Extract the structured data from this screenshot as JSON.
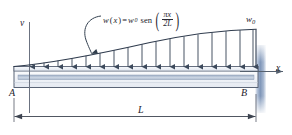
{
  "figure": {
    "kind": "cantilever-beam-distributed-load",
    "labels": {
      "vertical_axis": "v",
      "horizontal_axis": "x",
      "left_end": "A",
      "right_end": "B",
      "span_dimension": "L",
      "peak_load": "w",
      "peak_load_subscript": "0"
    },
    "equation": {
      "lhs_fn": "w",
      "lhs_arg": "x",
      "equals": "=",
      "amplitude": "w",
      "amplitude_subscript": "0",
      "function_name": "sen",
      "numerator": "πx",
      "denominator": "2L",
      "plain_text": "w(x) = w0 sen(πx / 2L)"
    },
    "colors": {
      "beam_outline": "#4a5568",
      "beam_fill_light": "#eef1f6",
      "beam_core": "#b9c4d4",
      "arrow": "#3d4a5c",
      "curve": "#2f3b4d",
      "wall": "#8fa3c0",
      "dimension_line": "#3d4450",
      "axis": "#6b7280",
      "text": "#23232c"
    },
    "geometry": {
      "beam_left_x": 14,
      "beam_right_x": 258,
      "beam_top_y": 66,
      "beam_bottom_y": 88,
      "load_peak_y": 30,
      "arrow_count": 17,
      "span_label_y": 117
    }
  }
}
